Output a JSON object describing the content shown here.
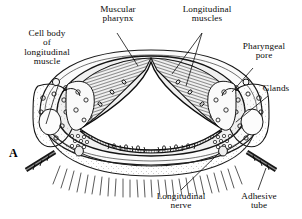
{
  "figure": {
    "kind": "anatomical-cross-section",
    "panel_letter": "A",
    "background_color": "#ffffff",
    "ink_color": "#111111",
    "lumen_color": "#ffffff"
  },
  "labels": {
    "cell_body": {
      "line1": "Cell body",
      "line2": "of",
      "line3": "longitudinal",
      "line4": "muscle"
    },
    "muscular_pharynx": {
      "line1": "Muscular",
      "line2": "pharynx"
    },
    "longitudinal_muscles": {
      "line1": "Longitudinal",
      "line2": "muscles"
    },
    "pharyngeal_pore": {
      "line1": "Pharyngeal",
      "line2": "pore"
    },
    "glands": {
      "line1": "Glands"
    },
    "longitudinal_nerve": {
      "line1": "Longitudinal",
      "line2": "nerve"
    },
    "adhesive_tube": {
      "line1": "Adhesive",
      "line2": "tube"
    },
    "panel_letter": "A"
  },
  "structures": {
    "lumen": "triradiate Y-shaped pharyngeal lumen",
    "pharyngeal_wall": "radially striated muscular wall",
    "cuticle": "outer body wall outline",
    "cilia": "ventral ciliary band",
    "adhesive_tubes": "paired lateral adhesive tubes",
    "gland_cells": "granular gland cells lateral to pharynx"
  }
}
